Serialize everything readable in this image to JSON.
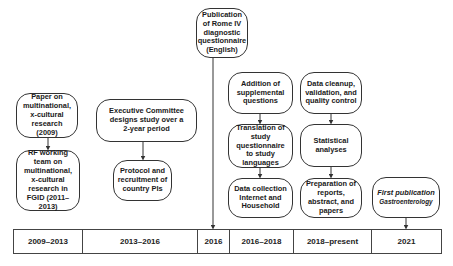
{
  "diagram": {
    "boxes": {
      "paper": "Paper on multinational, x-cultural research (2009)",
      "rf_team": "RF working team on multinational, x-cultural research in FGID (2011–2013)",
      "exec_committee": "Executive Committee designs study over a 2-year period",
      "protocol": "Protocol and recruitment of country PIs",
      "rome_iv": "Publication of Rome IV diagnostic questionnaire (English)",
      "addition": "Addition of supplemental questions",
      "translation": "Translation of study questionnaire to study languages",
      "data_collection": "Data collection Internet and Household",
      "data_cleanup": "Data cleanup, validation, and quality control",
      "statistical": "Statistical analyses",
      "preparation": "Preparation of reports, abstract, and papers",
      "first_publication_title": "First publication",
      "first_publication_journal": "Gastroenterology"
    },
    "timeline": [
      "2009–2013",
      "2013–2016",
      "2016",
      "2016–2018",
      "2018–present",
      "2021"
    ]
  }
}
